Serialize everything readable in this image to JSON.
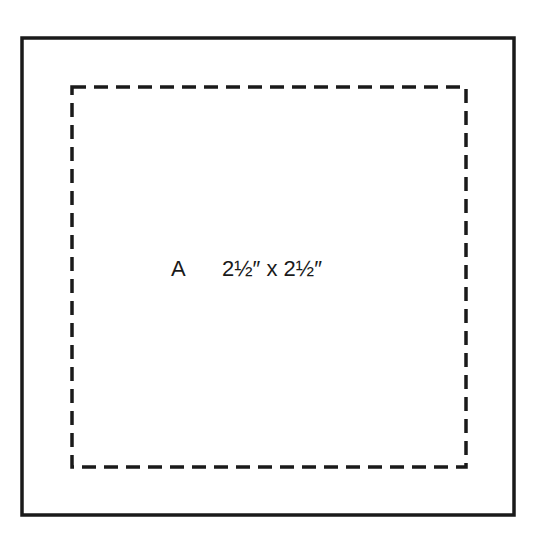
{
  "diagram": {
    "piece_label": "A",
    "dimensions": "2½″ x 2½″",
    "outer_square": {
      "x": 22,
      "y": 38,
      "w": 492,
      "h": 477,
      "stroke": "#1a1a1a"
    },
    "inner_square": {
      "x": 72,
      "y": 87,
      "w": 394,
      "h": 380,
      "stroke": "#1a1a1a",
      "style": "dashed"
    }
  }
}
